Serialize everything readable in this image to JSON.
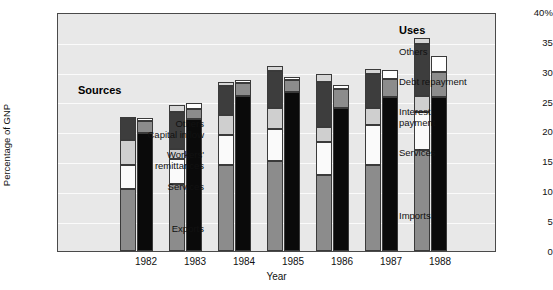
{
  "chart_data": {
    "type": "bar",
    "title": "",
    "xlabel": "Year",
    "ylabel": "Percentage of GNP",
    "ylim": [
      0,
      40
    ],
    "ytick_labels": [
      "40%",
      "35",
      "30",
      "25",
      "20",
      "15",
      "10",
      "5",
      "0"
    ],
    "ytick_values": [
      40,
      35,
      30,
      25,
      20,
      15,
      10,
      5,
      0
    ],
    "grid": true,
    "categories": [
      "1982",
      "1983",
      "1984",
      "1985",
      "1986",
      "1987",
      "1988"
    ],
    "groups": [
      {
        "name": "Sources",
        "legend_position": "inside-left",
        "segment_order_bottom_to_top": [
          "Exports",
          "Services",
          "Workers' remittances",
          "Capital inflow",
          "Others"
        ],
        "series": [
          {
            "name": "Exports",
            "color": "#8c8c8c",
            "values": [
              10.5,
              11.3,
              14.6,
              15.2,
              12.8,
              14.6,
              17.0
            ]
          },
          {
            "name": "Services",
            "color": "#fafafa",
            "values": [
              4.0,
              4.2,
              4.9,
              5.4,
              5.6,
              6.6,
              6.5
            ]
          },
          {
            "name": "Workers' remittances",
            "color": "#cfcfcf",
            "values": [
              4.2,
              1.8,
              3.4,
              3.5,
              2.6,
              3.0,
              2.7
            ]
          },
          {
            "name": "Capital inflow",
            "color": "#3d3d3d",
            "values": [
              3.5,
              6.2,
              5.0,
              6.2,
              7.6,
              5.6,
              8.8
            ]
          },
          {
            "name": "Others",
            "color": "#d6d6d6",
            "values": [
              0.3,
              1.1,
              0.7,
              1.0,
              1.2,
              0.9,
              1.0
            ]
          }
        ]
      },
      {
        "name": "Uses",
        "legend_position": "inside-right",
        "segment_order_bottom_to_top": [
          "Imports",
          "Services",
          "Interest payment",
          "Debt repayment",
          "Others"
        ],
        "series": [
          {
            "name": "Imports",
            "color": "#0a0a0a",
            "values": [
              20.0,
              22.2,
              26.2,
              26.8,
              24.2,
              26.0,
              26.0
            ]
          },
          {
            "name": "Services",
            "color": "#8c8c8c",
            "values": [
              2.0,
              1.7,
              2.2,
              2.1,
              3.2,
              3.0,
              4.2
            ]
          },
          {
            "name": "Interest payment",
            "color": "#f7f7f7",
            "values": [
              0.0,
              0.0,
              0.0,
              0.0,
              0.0,
              0.0,
              0.0
            ]
          },
          {
            "name": "Debt repayment",
            "color": "#3d3d3d",
            "values": [
              0.0,
              0.0,
              0.0,
              0.0,
              0.0,
              0.0,
              0.0
            ]
          },
          {
            "name": "Others",
            "color": "#ffffff",
            "values": [
              0.5,
              1.1,
              0.4,
              0.5,
              0.6,
              1.6,
              2.8
            ]
          }
        ]
      }
    ],
    "group_totals": {
      "sources": [
        22.5,
        24.6,
        28.6,
        31.3,
        29.8,
        30.7,
        36.0
      ],
      "uses": [
        22.5,
        25.0,
        28.4,
        29.4,
        28.0,
        30.6,
        33.0
      ]
    }
  },
  "left_legend": {
    "title": "Sources",
    "items": [
      {
        "label": "Others"
      },
      {
        "label": "Capital inflow"
      },
      {
        "label": "Workers'"
      },
      {
        "label": "remittances"
      },
      {
        "label": "Services"
      },
      {
        "label": "Exports"
      }
    ]
  },
  "right_legend": {
    "title": "Uses",
    "items": [
      {
        "label": "Others"
      },
      {
        "label": "Debt repayment"
      },
      {
        "label": "Interest"
      },
      {
        "label": "payment"
      },
      {
        "label": "Services"
      },
      {
        "label": "Imports"
      }
    ]
  },
  "axes": {
    "y_title": "Percentage of GNP",
    "x_title": "Year",
    "y_ticks": [
      "40%",
      "35",
      "30",
      "25",
      "20",
      "15",
      "10",
      "5",
      "0"
    ],
    "x_ticks": [
      "1982",
      "1983",
      "1984",
      "1985",
      "1986",
      "1987",
      "1988"
    ]
  },
  "caption": ""
}
